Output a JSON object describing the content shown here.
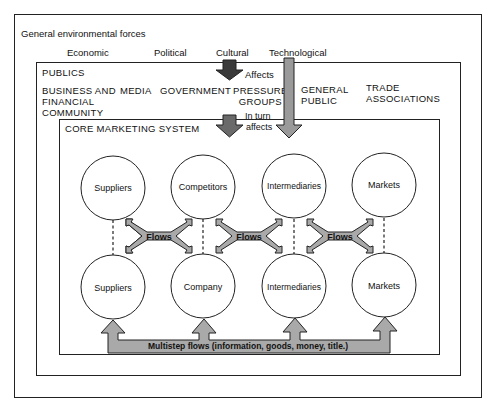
{
  "title": "General environmental forces",
  "forces": [
    {
      "label": "Economic"
    },
    {
      "label": "Political"
    },
    {
      "label": "Cultural"
    },
    {
      "label": "Technological"
    }
  ],
  "publics": {
    "title": "PUBLICS",
    "affects_label": "Affects",
    "in_turn_label": "In turn",
    "affects2_label": "affects",
    "groups": [
      {
        "line1": "BUSINESS AND",
        "line2": "FINANCIAL",
        "line3": "COMMUNITY"
      },
      {
        "line1": "MEDIA"
      },
      {
        "line1": "GOVERNMENT"
      },
      {
        "line1": "PRESSURE",
        "line2": "GROUPS"
      },
      {
        "line1": "GENERAL",
        "line2": "PUBLIC"
      },
      {
        "line1": "TRADE",
        "line2": "ASSOCIATIONS"
      }
    ]
  },
  "core": {
    "title": "CORE MARKETING SYSTEM",
    "top_nodes": [
      "Suppliers",
      "Competitors",
      "Intermediaries",
      "Markets"
    ],
    "bottom_nodes": [
      "Suppliers",
      "Company",
      "Intermediaries",
      "Markets"
    ],
    "flow_label": "Flows",
    "multistep_label": "Multistep flows (information, goods, money, title.)"
  },
  "colors": {
    "line": "#222222",
    "arrow_dark": "#3a3a3a",
    "arrow_fill": "#a9a9a9",
    "background": "#ffffff"
  }
}
